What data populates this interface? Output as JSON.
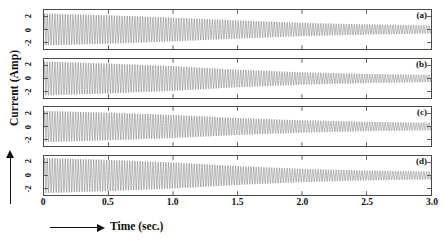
{
  "figure": {
    "background_color": "#ffffff",
    "trace_color": "#545454",
    "axis_color": "#4a4a4a"
  },
  "axes": {
    "x_title": "Time (sec.)",
    "y_title": "Current (Amp)",
    "x_arrow_icon": "right-arrow-icon",
    "y_arrow_icon": "up-arrow-icon",
    "x_ticks": [
      "0",
      "0.5",
      "1.0",
      "1.5",
      "2.0",
      "2.5",
      "3.0"
    ],
    "y_ticks": [
      "2",
      "0",
      "-2"
    ]
  },
  "panel_tags": [
    "(a)",
    "(b)",
    "(c)",
    "(d)"
  ],
  "chart_data": {
    "type": "line",
    "title": "",
    "xlabel": "Time (sec.)",
    "ylabel": "Current (Amp)",
    "xlim": [
      0,
      3.0
    ],
    "ylim": [
      -3.0,
      3.0
    ],
    "xticks": [
      0,
      0.5,
      1.0,
      1.5,
      2.0,
      2.5,
      3.0
    ],
    "yticks": [
      -2,
      0,
      2
    ],
    "grid": false,
    "legend_position": "none",
    "n_subplots": 4,
    "subplot_layout": "4 rows x 1 column, shared x-axis",
    "series": [
      {
        "name": "(a)",
        "panel": 1,
        "waveform": "damped sinusoid",
        "frequency_hz": 50,
        "initial_amplitude": 2.45,
        "final_amplitude": 0.62,
        "envelope_type": "exponential decay",
        "decay_constant_per_sec": 0.46,
        "mean_value": 0,
        "envelope_samples": [
          {
            "t": 0.0,
            "amp": 2.45
          },
          {
            "t": 0.5,
            "amp": 2.18
          },
          {
            "t": 1.0,
            "amp": 1.82
          },
          {
            "t": 1.5,
            "amp": 1.4
          },
          {
            "t": 2.0,
            "amp": 1.02
          },
          {
            "t": 2.5,
            "amp": 0.78
          },
          {
            "t": 3.0,
            "amp": 0.62
          }
        ]
      },
      {
        "name": "(b)",
        "panel": 2,
        "waveform": "damped sinusoid",
        "frequency_hz": 50,
        "initial_amplitude": 2.6,
        "final_amplitude": 0.55,
        "envelope_type": "exponential decay",
        "decay_constant_per_sec": 0.52,
        "mean_value": 0,
        "envelope_samples": [
          {
            "t": 0.0,
            "amp": 2.6
          },
          {
            "t": 0.5,
            "amp": 2.3
          },
          {
            "t": 1.0,
            "amp": 1.9
          },
          {
            "t": 1.5,
            "amp": 1.35
          },
          {
            "t": 2.0,
            "amp": 0.95
          },
          {
            "t": 2.5,
            "amp": 0.7
          },
          {
            "t": 3.0,
            "amp": 0.55
          }
        ]
      },
      {
        "name": "(c)",
        "panel": 3,
        "waveform": "damped sinusoid",
        "frequency_hz": 50,
        "initial_amplitude": 2.4,
        "final_amplitude": 0.58,
        "envelope_type": "exponential decay",
        "decay_constant_per_sec": 0.47,
        "mean_value": 0,
        "envelope_samples": [
          {
            "t": 0.0,
            "amp": 2.4
          },
          {
            "t": 0.5,
            "amp": 2.12
          },
          {
            "t": 1.0,
            "amp": 1.78
          },
          {
            "t": 1.5,
            "amp": 1.3
          },
          {
            "t": 2.0,
            "amp": 0.95
          },
          {
            "t": 2.5,
            "amp": 0.72
          },
          {
            "t": 3.0,
            "amp": 0.58
          }
        ]
      },
      {
        "name": "(d)",
        "panel": 4,
        "waveform": "damped sinusoid",
        "frequency_hz": 50,
        "initial_amplitude": 2.7,
        "final_amplitude": 0.6,
        "envelope_type": "exponential decay",
        "decay_constant_per_sec": 0.5,
        "mean_value": 0,
        "envelope_samples": [
          {
            "t": 0.0,
            "amp": 2.7
          },
          {
            "t": 0.5,
            "amp": 2.4
          },
          {
            "t": 1.0,
            "amp": 2.0
          },
          {
            "t": 1.5,
            "amp": 1.45
          },
          {
            "t": 2.0,
            "amp": 1.02
          },
          {
            "t": 2.5,
            "amp": 0.75
          },
          {
            "t": 3.0,
            "amp": 0.6
          }
        ]
      }
    ]
  }
}
